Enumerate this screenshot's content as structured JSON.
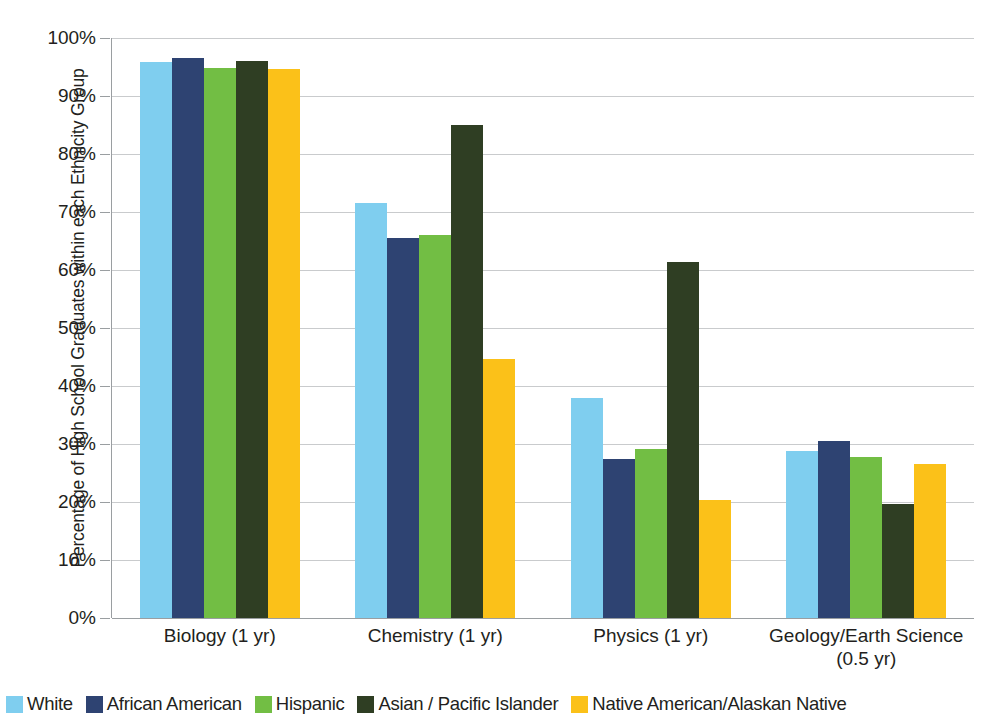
{
  "chart_data": {
    "type": "bar",
    "title": "",
    "xlabel": "",
    "ylabel": "Percentage of High School Graduates within each Ethnicity Group",
    "ylim": [
      0,
      100
    ],
    "ytick_labels": [
      "100%",
      "90%",
      "80%",
      "70%",
      "60%",
      "50%",
      "40%",
      "30%",
      "20%",
      "10%",
      "0%"
    ],
    "ytick_values": [
      100,
      90,
      80,
      70,
      60,
      50,
      40,
      30,
      20,
      10,
      0
    ],
    "grid": true,
    "legend_position": "bottom",
    "categories": [
      "Biology (1 yr)",
      "Chemistry (1 yr)",
      "Physics (1 yr)",
      "Geology/Earth Science\n(0.5 yr)"
    ],
    "series": [
      {
        "name": "White",
        "color": "#7FCEEF",
        "values": [
          95.8,
          71.6,
          38.0,
          28.8
        ]
      },
      {
        "name": "African American",
        "color": "#2E4372",
        "values": [
          96.5,
          65.6,
          27.4,
          30.5
        ]
      },
      {
        "name": "Hispanic",
        "color": "#72BE44",
        "values": [
          94.9,
          66.0,
          29.1,
          27.7
        ]
      },
      {
        "name": "Asian / Pacific Islander",
        "color": "#2F3E23",
        "values": [
          96.0,
          85.0,
          61.4,
          19.6
        ]
      },
      {
        "name": "Native American/Alaskan Native",
        "color": "#FBC119",
        "values": [
          94.7,
          44.7,
          20.4,
          26.6
        ]
      }
    ]
  },
  "colors": {
    "gridline": "#c9cbcd",
    "axis": "#9a9ea1",
    "text": "#231f20",
    "background": "#ffffff"
  }
}
